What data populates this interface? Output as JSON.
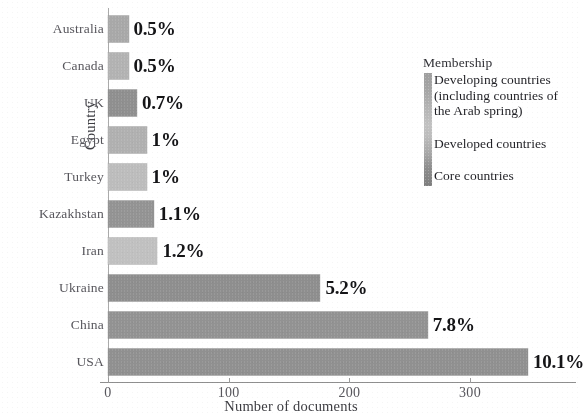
{
  "chart_data": {
    "type": "bar",
    "orientation": "horizontal",
    "title": "",
    "xlabel": "Number of documents",
    "ylabel": "Country",
    "categories": [
      "Australia",
      "Canada",
      "UK",
      "Egypt",
      "Turkey",
      "Kazakhstan",
      "Iran",
      "Ukraine",
      "China",
      "USA"
    ],
    "values": [
      17,
      17,
      24,
      32,
      32,
      38,
      41,
      176,
      265,
      348
    ],
    "data_labels": [
      "0.5%",
      "0.5%",
      "0.7%",
      "1%",
      "1%",
      "1.1%",
      "1.2%",
      "5.2%",
      "7.8%",
      "10.1%"
    ],
    "bar_colors": [
      "#a8a8a8",
      "#b2b2b2",
      "#8e8e8e",
      "#b0b0b0",
      "#bcbcbc",
      "#929292",
      "#c0c0c0",
      "#8d8d8d",
      "#919191",
      "#8f8f8f"
    ],
    "xlim": [
      0,
      383
    ],
    "xticks": [
      0,
      100,
      200,
      300
    ],
    "xtick_labels": [
      "0",
      "100",
      "200",
      "300"
    ],
    "grid": false,
    "legend": {
      "title": "Membership",
      "position": "right",
      "style": "continuous-colorbar",
      "entries": [
        "Developing countries (including countries of the Arab spring)",
        "Developed countries",
        "Core countries"
      ],
      "entry_lines": [
        [
          "Developing countries",
          "(including countries of",
          "the Arab spring)"
        ],
        [
          "Developed countries"
        ],
        [
          "Core countries"
        ]
      ]
    }
  }
}
